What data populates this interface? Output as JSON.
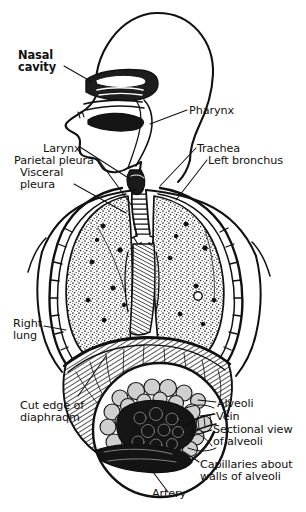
{
  "figure": {
    "style": "engraved pen-and-ink anatomical illustration",
    "background_color": "#ffffff",
    "ink_color": "#111111"
  },
  "labels": {
    "nasal_cavity": {
      "text": "Nasal\ncavity",
      "x": 18,
      "y": 50,
      "align": "left",
      "bold": true
    },
    "pharynx": {
      "text": "Pharynx",
      "x": 189,
      "y": 105,
      "align": "left",
      "bold": false
    },
    "larynx": {
      "text": "Larynx",
      "x": 43,
      "y": 143,
      "align": "left",
      "bold": false
    },
    "parietal": {
      "text": "Parietal pleura",
      "x": 14,
      "y": 155,
      "align": "left",
      "bold": false
    },
    "visceral": {
      "text": "Visceral\npleura",
      "x": 20,
      "y": 167,
      "align": "left",
      "bold": false
    },
    "trachea": {
      "text": "Trachea",
      "x": 197,
      "y": 143,
      "align": "left",
      "bold": false
    },
    "left_bronchus": {
      "text": "Left bronchus",
      "x": 208,
      "y": 155,
      "align": "left",
      "bold": false
    },
    "right_lung": {
      "text": "Right\nlung",
      "x": 13,
      "y": 318,
      "align": "left",
      "bold": false
    },
    "cut_edge": {
      "text": "Cut edge of\ndiaphraqm",
      "x": 20,
      "y": 400,
      "align": "left",
      "bold": false
    },
    "alveoli": {
      "text": "Alveoli",
      "x": 217,
      "y": 398,
      "align": "left",
      "bold": false
    },
    "vein": {
      "text": "Vein",
      "x": 216,
      "y": 411,
      "align": "left",
      "bold": false
    },
    "sectional": {
      "text": "Sectional view\nof alveoli",
      "x": 213,
      "y": 424,
      "align": "left",
      "bold": false
    },
    "capillaries": {
      "text": "Capillaries about\nwalls of alveoli",
      "x": 200,
      "y": 459,
      "align": "left",
      "bold": false
    },
    "artery": {
      "text": "Artery",
      "x": 152,
      "y": 488,
      "align": "left",
      "bold": false
    }
  },
  "anatomy_parts": [
    "nasal cavity",
    "pharynx",
    "larynx",
    "trachea",
    "left bronchus",
    "right lung",
    "left lung",
    "parietal pleura",
    "visceral pleura",
    "diaphragm",
    "alveoli",
    "vein",
    "artery",
    "capillaries",
    "bronchiole"
  ],
  "inset": {
    "name": "sectional-view-of-alveoli",
    "shape": "circle",
    "center_x": 160,
    "center_y": 430,
    "radius": 68
  }
}
